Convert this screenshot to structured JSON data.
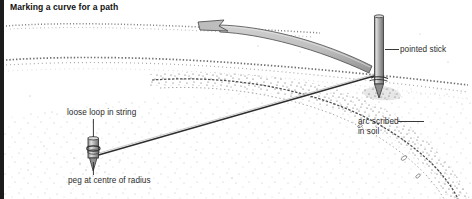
{
  "figure": {
    "title": "Marking a curve for a path",
    "accent_rule_color": "#1b1b1b",
    "background_color": "#ffffff",
    "ink_color": "#2b2b2b",
    "tool_fill_color": "#b4b4b4"
  },
  "callouts": {
    "pointed_stick": "pointed stick",
    "loose_loop": "loose loop in string",
    "arc_scribed_line1": "arc scribed",
    "arc_scribed_line2": "in soil",
    "peg_centre": "peg at centre of radius"
  },
  "icons": {
    "sweep_arrow": "curved-sweep-arrow-icon",
    "stick": "pointed-stick-icon",
    "peg": "ground-peg-icon",
    "string": "taut-string-icon",
    "arc": "scribed-arc-icon",
    "ground": "soil-ground-texture-icon"
  }
}
